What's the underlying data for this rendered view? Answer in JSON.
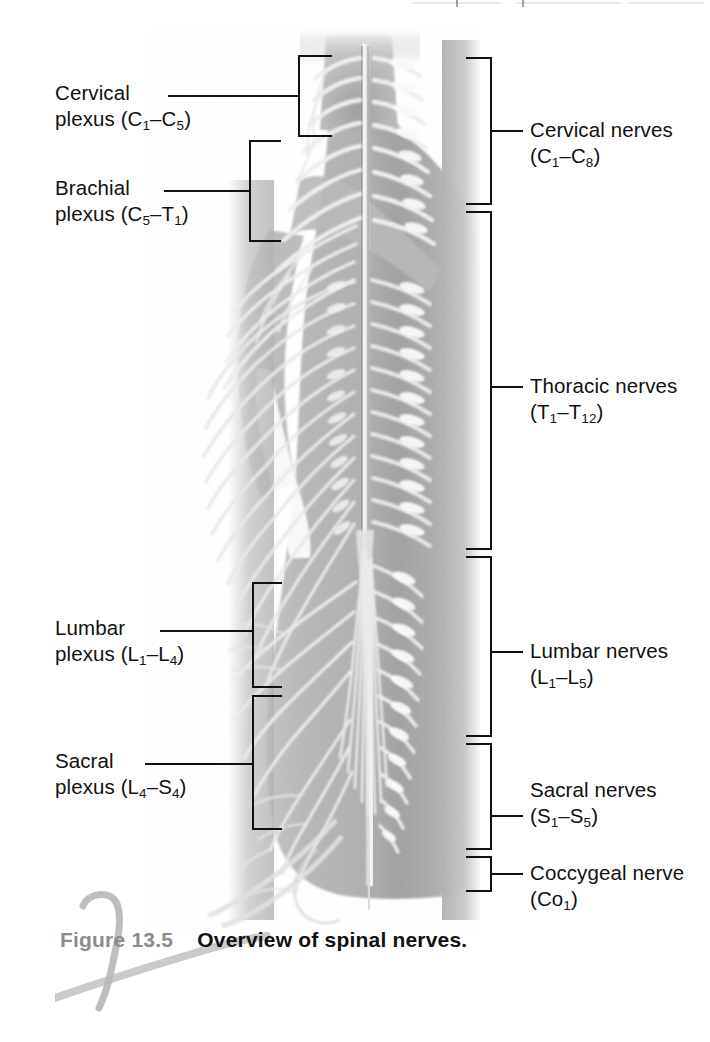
{
  "figure": {
    "number": "Figure 13.5",
    "caption": "Overview of spinal nerves."
  },
  "left_labels": [
    {
      "id": "cervical-plexus",
      "line1": "Cervical",
      "line2_prefix": "plexus (C",
      "line2_sub1": "1",
      "line2_mid": "–C",
      "line2_sub2": "5",
      "line2_suffix": ")",
      "full_text": "Cervical plexus (C1–C5)"
    },
    {
      "id": "brachial-plexus",
      "line1": "Brachial",
      "line2_prefix": "plexus (C",
      "line2_sub1": "5",
      "line2_mid": "–T",
      "line2_sub2": "1",
      "line2_suffix": ")",
      "full_text": "Brachial plexus (C5–T1)"
    },
    {
      "id": "lumbar-plexus",
      "line1": "Lumbar",
      "line2_prefix": "plexus (L",
      "line2_sub1": "1",
      "line2_mid": "–L",
      "line2_sub2": "4",
      "line2_suffix": ")",
      "full_text": "Lumbar plexus (L1–L4)"
    },
    {
      "id": "sacral-plexus",
      "line1": "Sacral",
      "line2_prefix": "plexus (L",
      "line2_sub1": "4",
      "line2_mid": "–S",
      "line2_sub2": "4",
      "line2_suffix": ")",
      "full_text": "Sacral plexus (L4–S4)"
    }
  ],
  "right_labels": [
    {
      "id": "cervical-nerves",
      "line1": "Cervical nerves",
      "line2_prefix": "(C",
      "line2_sub1": "1",
      "line2_mid": "–C",
      "line2_sub2": "8",
      "line2_suffix": ")",
      "full_text": "Cervical nerves (C1–C8)"
    },
    {
      "id": "thoracic-nerves",
      "line1": "Thoracic nerves",
      "line2_prefix": "(T",
      "line2_sub1": "1",
      "line2_mid": "–T",
      "line2_sub2": "12",
      "line2_suffix": ")",
      "full_text": "Thoracic nerves (T1–T12)"
    },
    {
      "id": "lumbar-nerves",
      "line1": "Lumbar nerves",
      "line2_prefix": "(L",
      "line2_sub1": "1",
      "line2_mid": "–L",
      "line2_sub2": "5",
      "line2_suffix": ")",
      "full_text": "Lumbar nerves (L1–L5)"
    },
    {
      "id": "sacral-nerves",
      "line1": "Sacral nerves",
      "line2_prefix": "(S",
      "line2_sub1": "1",
      "line2_mid": "–S",
      "line2_sub2": "5",
      "line2_suffix": ")",
      "full_text": "Sacral nerves (S1–S5)"
    },
    {
      "id": "coccygeal-nerve",
      "line1": "Coccygeal nerve",
      "line2_prefix": "(Co",
      "line2_sub1": "1",
      "line2_mid": "",
      "line2_sub2": "",
      "line2_suffix": ")",
      "full_text": "Coccygeal nerve (Co1)"
    }
  ],
  "colors": {
    "ink": "#111111",
    "fignum_gray": "#8c8c8c",
    "body_gray": "#b4b4b4",
    "body_gray_dark": "#9a9a9a",
    "nerve_light": "#eeeeee",
    "page_background": "#ffffff"
  }
}
